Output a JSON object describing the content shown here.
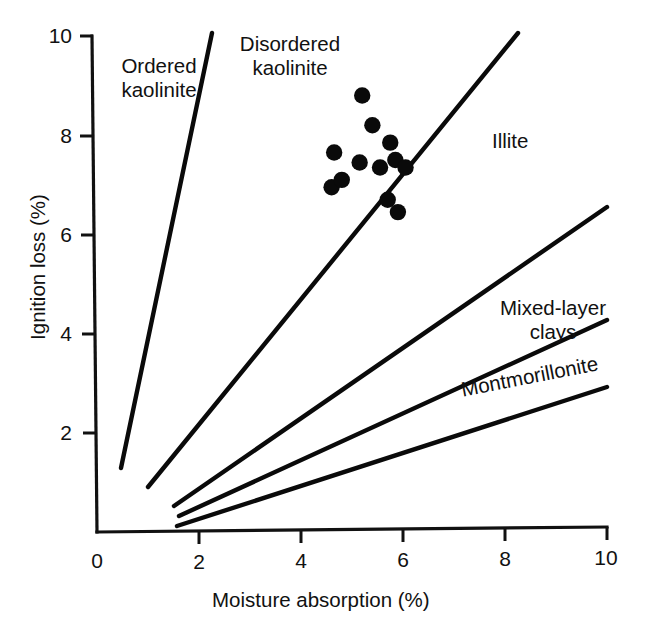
{
  "chart_data": {
    "type": "scatter",
    "title": "",
    "xlabel": "Moisture absorption (%)",
    "ylabel": "Ignition loss (%)",
    "xlim": [
      0,
      10
    ],
    "ylim": [
      0,
      10
    ],
    "xticks": [
      0,
      2,
      4,
      6,
      8,
      10
    ],
    "yticks": [
      0,
      2,
      4,
      6,
      8,
      10
    ],
    "xticklabels": [
      "0",
      "2",
      "4",
      "6",
      "8",
      "10"
    ],
    "yticklabels": [
      "0",
      "2",
      "4",
      "6",
      "8",
      "10"
    ],
    "grid": false,
    "legend": "none",
    "annotations": [
      {
        "name": "ordered-kaolinite",
        "text": "Ordered\nkaolinite",
        "x": 1.1,
        "y": 9.1
      },
      {
        "name": "disordered-kaolinite",
        "text": "Disordered\nkaolinite",
        "x": 3.7,
        "y": 9.6
      },
      {
        "name": "illite",
        "text": "Illite",
        "x": 8.0,
        "y": 7.8
      },
      {
        "name": "mixed-layer-clays",
        "text": "Mixed-layer\nclays",
        "x": 8.2,
        "y": 3.9
      },
      {
        "name": "montmorillonite",
        "text": "Montmorillonite",
        "x": 7.2,
        "y": 3.2
      }
    ],
    "boundary_lines": [
      {
        "name": "ordered-disordered-kaolinite-boundary",
        "x": [
          0.5,
          2.2
        ],
        "y": [
          1.55,
          10.0
        ]
      },
      {
        "name": "disordered-kaolinite-illite-boundary",
        "x": [
          1.1,
          8.25
        ],
        "y": [
          1.25,
          10.0
        ]
      },
      {
        "name": "illite-mixed-layer-boundary",
        "x": [
          1.5,
          10.0
        ],
        "y": [
          0.92,
          6.45
        ]
      },
      {
        "name": "mixed-layer-montmorillonite-boundary",
        "x": [
          1.6,
          10.0
        ],
        "y": [
          0.72,
          4.15
        ]
      },
      {
        "name": "montmorillonite-lower-boundary",
        "x": [
          1.55,
          10.0
        ],
        "y": [
          0.52,
          2.9
        ]
      }
    ],
    "series": [
      {
        "name": "clay samples",
        "marker": "filled-circle",
        "color": "#0a0a0a",
        "points": [
          {
            "x": 5.2,
            "y": 8.8
          },
          {
            "x": 5.4,
            "y": 8.2
          },
          {
            "x": 5.75,
            "y": 7.85
          },
          {
            "x": 4.65,
            "y": 7.65
          },
          {
            "x": 5.85,
            "y": 7.5
          },
          {
            "x": 5.15,
            "y": 7.45
          },
          {
            "x": 5.55,
            "y": 7.35
          },
          {
            "x": 6.05,
            "y": 7.35
          },
          {
            "x": 4.6,
            "y": 6.95
          },
          {
            "x": 4.8,
            "y": 7.1
          },
          {
            "x": 5.7,
            "y": 6.7
          },
          {
            "x": 5.9,
            "y": 6.45
          }
        ]
      }
    ]
  },
  "axes": {
    "x_title": "Moisture absorption (%)",
    "y_title": "Ignition loss (%)",
    "x_tick_labels": [
      "0",
      "2",
      "4",
      "6",
      "8",
      "10"
    ],
    "y_tick_labels": [
      "0",
      "2",
      "4",
      "6",
      "8",
      "10"
    ]
  },
  "labels": {
    "ordered_kaolinite": "Ordered\nkaolinite",
    "disordered_kaolinite": "Disordered\nkaolinite",
    "illite": "Illite",
    "mixed_layer_clays": "Mixed-layer\nclays",
    "montmorillonite": "Montmorillonite"
  },
  "colors": {
    "ink": "#0a0a0a",
    "background": "#ffffff"
  }
}
